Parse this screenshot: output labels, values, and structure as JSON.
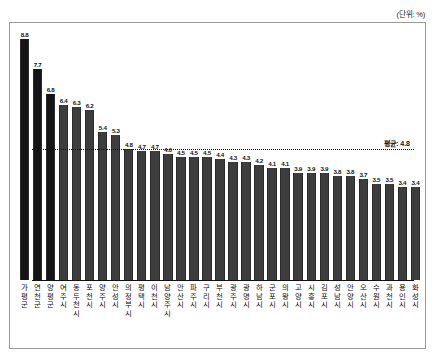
{
  "unit_note": "(단위: %)",
  "average": {
    "label": "평균: 4.8",
    "value": 4.8
  },
  "chart_data": {
    "type": "bar",
    "title": "",
    "subtitle": "",
    "xlabel": "",
    "ylabel": "",
    "unit": "%",
    "ylim": [
      0,
      9.2
    ],
    "grid": false,
    "legend": "none",
    "annotations": [
      "(단위: %)",
      "평균: 4.8"
    ],
    "average_line": 4.8,
    "categories": [
      "가평군",
      "연천군",
      "양평군",
      "여주시",
      "동두천시",
      "포천시",
      "양주시",
      "안성시",
      "의정부시",
      "평택시",
      "이천시",
      "남양주시",
      "안산시",
      "파주시",
      "구리시",
      "부천시",
      "광주시",
      "광명시",
      "하남시",
      "군포시",
      "의왕시",
      "고양시",
      "시흥시",
      "김포시",
      "성남시",
      "안양시",
      "오산시",
      "수원시",
      "과천시",
      "용인시",
      "화성시"
    ],
    "values": [
      8.8,
      7.7,
      6.8,
      6.4,
      6.3,
      6.2,
      5.4,
      5.3,
      4.8,
      4.7,
      4.7,
      4.6,
      4.5,
      4.5,
      4.5,
      4.4,
      4.3,
      4.3,
      4.2,
      4.1,
      4.1,
      3.9,
      3.9,
      3.9,
      3.8,
      3.8,
      3.7,
      3.5,
      3.5,
      3.4,
      3.4
    ],
    "value_labels": [
      "8.8",
      "7.7",
      "6.8",
      "6.4",
      "6.3",
      "6.2",
      "5.4",
      "5.3",
      "4.8",
      "4.7",
      "4.7",
      "4.6",
      "4.5",
      "4.5",
      "4.5",
      "4.4",
      "4.3",
      "4.3",
      "4.2",
      "4.1",
      "4.1",
      "3.9",
      "3.9",
      "3.9",
      "3.8",
      "3.8",
      "3.7",
      "3.5",
      "3.5",
      "3.4",
      "3.4"
    ],
    "highlighted_indices": [
      0,
      1,
      2
    ]
  }
}
